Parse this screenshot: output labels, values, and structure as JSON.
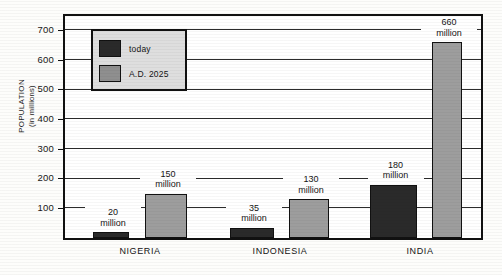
{
  "chart_data": {
    "type": "bar",
    "title": "",
    "xlabel": "",
    "ylabel_line1": "POPULATION",
    "ylabel_line2": "(in millions)",
    "ylim": [
      0,
      745
    ],
    "yticks": [
      100,
      200,
      300,
      400,
      500,
      600,
      700
    ],
    "ytick_labels": [
      "100",
      "200",
      "300",
      "400",
      "500",
      "600",
      "700"
    ],
    "grid": true,
    "legend_position": "upper-left-inside",
    "categories": [
      "NIGERIA",
      "INDONESIA",
      "INDIA"
    ],
    "series": [
      {
        "name": "today",
        "color": "#2a2a2a",
        "values": [
          20,
          35,
          180
        ],
        "value_labels": [
          "20\nmillion",
          "35\nmillion",
          "180\nmillion"
        ]
      },
      {
        "name": "A.D. 2025",
        "color": "#9d9d9d",
        "values": [
          150,
          130,
          660
        ],
        "value_labels": [
          "150\nmillion",
          "130\nmillion",
          "660\nmillion"
        ]
      }
    ],
    "unit_word": "million"
  },
  "axis": {
    "y_caption_line1": "POPULATION",
    "y_caption_line2": "(in millions)",
    "ticks": [
      {
        "value": "700"
      },
      {
        "value": "600"
      },
      {
        "value": "500"
      },
      {
        "value": "400"
      },
      {
        "value": "300"
      },
      {
        "value": "200"
      },
      {
        "value": "100"
      }
    ]
  },
  "legend": {
    "items": [
      {
        "label": "today",
        "color": "#2a2a2a"
      },
      {
        "label": "A.D. 2025",
        "color": "#8f8f8f"
      }
    ]
  },
  "groups": [
    {
      "name": "NIGERIA",
      "today_value": "20",
      "today_unit": "million",
      "future_value": "150",
      "future_unit": "million"
    },
    {
      "name": "INDONESIA",
      "today_value": "35",
      "today_unit": "million",
      "future_value": "130",
      "future_unit": "million"
    },
    {
      "name": "INDIA",
      "today_value": "180",
      "today_unit": "million",
      "future_value": "660",
      "future_unit": "million"
    }
  ],
  "colors": {
    "today": "#2a2a2a",
    "future": "#9d9d9d",
    "frame": "#111111",
    "legend_bg": "#dedede",
    "page_bg": "#fdfdfb"
  }
}
